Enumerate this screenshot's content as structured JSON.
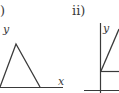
{
  "panels": [
    {
      "label": ")",
      "full_label": "i)",
      "y_axis_label": "y",
      "x_axis_label": "x",
      "shape": "triangle",
      "triangle": {
        "left": [
          0,
          87
        ],
        "apex": [
          16,
          44
        ],
        "right": [
          40,
          87
        ]
      },
      "x_axis": {
        "from": [
          0,
          87
        ],
        "to": [
          63,
          87
        ]
      }
    },
    {
      "label": "ii)",
      "y_axis_label": "y",
      "shape": "line-from-axis",
      "y_axis": {
        "from": [
          100,
          23
        ],
        "to": [
          100,
          93
        ]
      },
      "diagonal": {
        "from": [
          101,
          71
        ],
        "to": [
          119,
          30
        ]
      },
      "horizontal_mid": {
        "from": [
          101,
          71
        ],
        "to": [
          119,
          71
        ]
      },
      "x_axis": {
        "from": [
          84,
          90
        ],
        "to": [
          119,
          90
        ]
      }
    }
  ],
  "colors": {
    "line": "#3a3a3a",
    "text": "#3a3a3a",
    "background": "#ffffff"
  }
}
